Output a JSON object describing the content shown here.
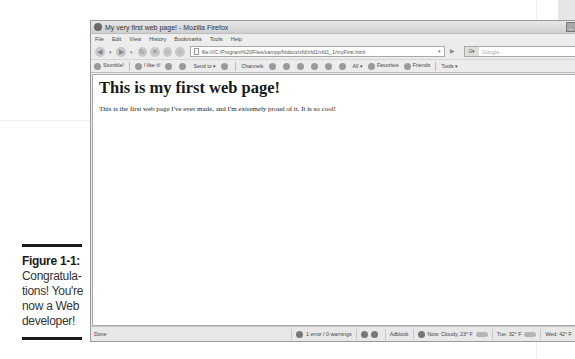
{
  "caption": {
    "title": "Figure 1-1:",
    "text": "Congratula-tions! You're now a Web developer!"
  },
  "browser": {
    "title": "My very first web page! - Mozilla Firefox",
    "window_controls": {
      "minimize": "_",
      "maximize": "□",
      "close": "✕"
    },
    "menu": [
      "File",
      "Edit",
      "View",
      "History",
      "Bookmarks",
      "Tools",
      "Help"
    ],
    "nav": {
      "back": "◀",
      "forward": "▶",
      "reload": "↻",
      "stop": "✕",
      "home": "⌂",
      "url": "file:///C:/Program%20Files/xampp/htdocs/xfd/xfd1/xfd1_1/myFirst.html",
      "url_dropdown": "▾",
      "go": "▶",
      "search_engine": "G▾",
      "search_placeholder": "Google",
      "search_button": "🔍"
    },
    "extensions": [
      {
        "label": "StumbleUpon",
        "short": "Stumble!"
      },
      {
        "label": "I like it!"
      },
      {
        "label": "Send to ▾"
      },
      {
        "label": "Channels"
      },
      {
        "label": "All ▾"
      },
      {
        "label": "Favorites"
      },
      {
        "label": "Friends"
      },
      {
        "label": "Tools ▾"
      }
    ],
    "page": {
      "heading": "This is my first web page!",
      "paragraph": "This is the first web page I've ever made, and I'm extremely proud of it. It is so cool!"
    },
    "status": {
      "left": "Done",
      "errors": "1 error / 0 warnings",
      "adblock": "Adblock",
      "weather_now": "Now: Cloudy, 23° F",
      "weather_tue": "Tue: 32° F",
      "weather_wed": "Wed: 42° F"
    }
  }
}
